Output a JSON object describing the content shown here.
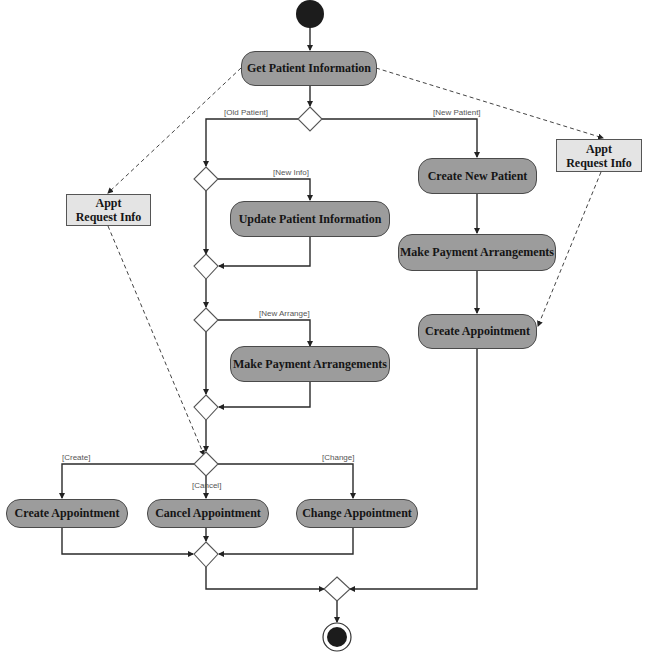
{
  "diagram": {
    "type": "UML activity diagram",
    "start_node": "initial",
    "end_node": "final",
    "activities": {
      "get_patient_info": "Get Patient Information",
      "update_patient_info": "Update Patient Information",
      "make_payment_left": "Make Payment Arrangements",
      "create_new_patient": "Create New Patient",
      "make_payment_right": "Make Payment Arrangements",
      "create_appointment_right": "Create Appointment",
      "create_appointment": "Create Appointment",
      "cancel_appointment": "Cancel Appointment",
      "change_appointment": "Change Appointment"
    },
    "objects": {
      "left": {
        "line1": "Appt",
        "line2": "Request Info"
      },
      "right": {
        "line1": "Appt",
        "line2": "Request Info"
      }
    },
    "guards": {
      "old_patient": "[Old Patient]",
      "new_patient": "[New Patient]",
      "new_info": "[New Info]",
      "new_arrange": "[New Arrange]",
      "create": "[Create]",
      "cancel": "[Cancel]",
      "change": "[Change]"
    },
    "colors": {
      "activity_fill": "#9c9c9c",
      "object_fill": "#e4e4e4",
      "line": "#2a2a2a",
      "start_end": "#1c1c1c"
    }
  }
}
